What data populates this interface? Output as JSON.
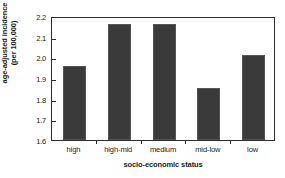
{
  "chart_data": {
    "type": "bar",
    "title": "",
    "subtitle": "",
    "categories": [
      "high",
      "high-mid",
      "medium",
      "mid-low",
      "low"
    ],
    "values": [
      1.96,
      2.16,
      2.16,
      1.85,
      2.01
    ],
    "xlabel": "socio-economic status",
    "ylabel": "age-adjusted incidence (per 100,000)",
    "ylabel_lines": [
      "age-adjusted incidence",
      "(per 100,000)"
    ],
    "ylim": [
      1.6,
      2.2
    ],
    "yticks": [
      1.6,
      1.7,
      1.8,
      1.9,
      2.0,
      2.1,
      2.2
    ],
    "ytick_labels": [
      "1.6",
      "1.7",
      "1.8",
      "1.9",
      "2.0",
      "2.1",
      "2.2"
    ],
    "grid": false,
    "legend": null,
    "legend_position": "none",
    "bar_color": "#3a3a3a",
    "axis_color": "#2b2b2b",
    "background_color": "#ffffff",
    "annotations": []
  }
}
